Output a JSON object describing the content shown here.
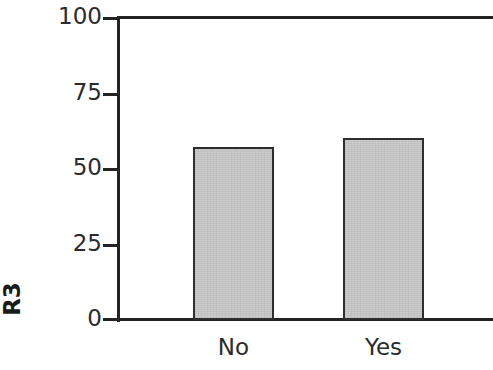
{
  "chart_data": {
    "type": "bar",
    "title": "",
    "xlabel": "",
    "ylabel": "R3",
    "categories": [
      "No",
      "Yes"
    ],
    "values": [
      57,
      60
    ],
    "ylim": [
      0,
      100
    ],
    "yticks": [
      0,
      25,
      50,
      75,
      100
    ],
    "ytick_labels": [
      "0",
      "25",
      "50",
      "75",
      "100"
    ],
    "grid": false,
    "legend": null,
    "colors": {
      "bar_fill": "#c9c9c9",
      "bar_edge": "#2e2e2e",
      "axis": "#232323",
      "text": "#2b2b2b",
      "background": "#ffffff"
    }
  },
  "axis": {
    "y_title": "R3",
    "tick_0": "0",
    "tick_25": "25",
    "tick_50": "50",
    "tick_75": "75",
    "tick_100": "100"
  },
  "categories": {
    "first": "No",
    "second": "Yes"
  }
}
